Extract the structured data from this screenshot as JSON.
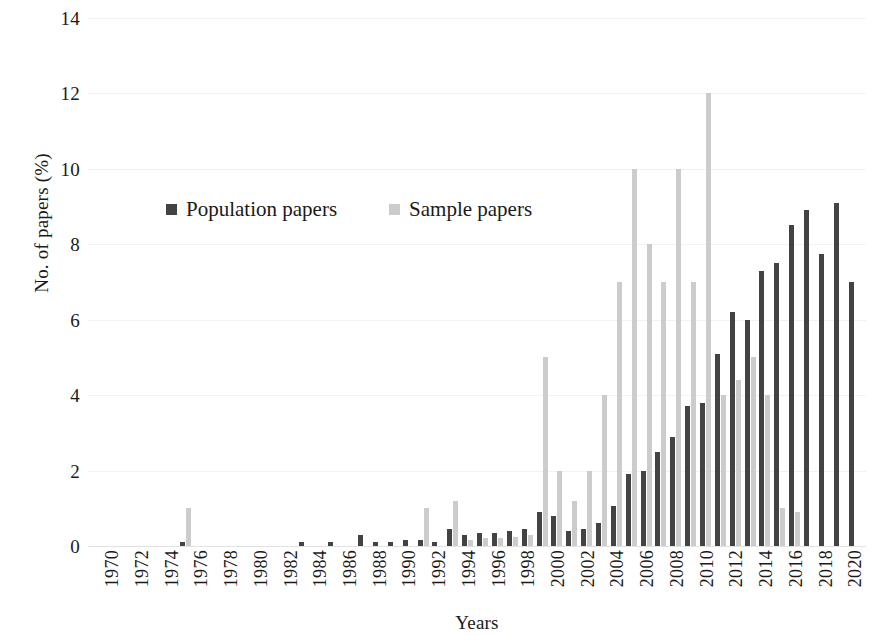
{
  "chart_data": {
    "type": "bar",
    "title": "",
    "xlabel": "Years",
    "ylabel": "No. of papers (%)",
    "ylim": [
      0,
      14
    ],
    "ytick_values": [
      0,
      2,
      4,
      6,
      8,
      10,
      12,
      14
    ],
    "ytick_labels": [
      "0",
      "2",
      "4",
      "6",
      "8",
      "10",
      "12",
      "14"
    ],
    "grid": true,
    "legend_position": "upper-left-inside",
    "xtick_labels": [
      "1970",
      "1972",
      "1974",
      "1976",
      "1978",
      "1980",
      "1982",
      "1984",
      "1986",
      "1988",
      "1990",
      "1992",
      "1994",
      "1996",
      "1998",
      "2000",
      "2002",
      "2004",
      "2006",
      "2008",
      "2010",
      "2012",
      "2014",
      "2016",
      "2018",
      "2020"
    ],
    "categories": [
      "1970",
      "1971",
      "1972",
      "1973",
      "1974",
      "1975",
      "1976",
      "1977",
      "1978",
      "1979",
      "1980",
      "1981",
      "1982",
      "1983",
      "1984",
      "1985",
      "1986",
      "1987",
      "1988",
      "1989",
      "1990",
      "1991",
      "1992",
      "1993",
      "1994",
      "1995",
      "1996",
      "1997",
      "1998",
      "1999",
      "2000",
      "2001",
      "2002",
      "2003",
      "2004",
      "2005",
      "2006",
      "2007",
      "2008",
      "2009",
      "2010",
      "2011",
      "2012",
      "2013",
      "2014",
      "2015",
      "2016",
      "2017",
      "2018",
      "2019",
      "2020",
      "2021"
    ],
    "series": [
      {
        "name": "Population papers",
        "color": "#434343",
        "values": [
          0,
          0,
          0,
          0,
          0,
          0,
          0.1,
          0,
          0,
          0,
          0,
          0,
          0,
          0,
          0.1,
          0,
          0.1,
          0,
          0.3,
          0.1,
          0.1,
          0.15,
          0.15,
          0.1,
          0.45,
          0.3,
          0.35,
          0.35,
          0.4,
          0.45,
          0.9,
          0.8,
          0.4,
          0.45,
          0.6,
          1.05,
          1.9,
          2.0,
          2.5,
          2.9,
          3.7,
          3.8,
          5.1,
          6.2,
          6.0,
          7.3,
          7.5,
          8.5,
          8.9,
          7.75,
          9.1,
          7.0
        ]
      },
      {
        "name": "Sample papers",
        "color": "#cccccc",
        "values": [
          0,
          0,
          0,
          0,
          0,
          0,
          1.0,
          0,
          0,
          0,
          0,
          0,
          0,
          0,
          0,
          0,
          0,
          0,
          0,
          0,
          0,
          0,
          1.0,
          0,
          1.2,
          0.15,
          0.2,
          0.2,
          0.25,
          0.3,
          5.0,
          2.0,
          1.2,
          2.0,
          4.0,
          7.0,
          10.0,
          8.0,
          7.0,
          10.0,
          7.0,
          12.0,
          4.0,
          4.4,
          5.0,
          4.0,
          1.0,
          0.9,
          0,
          0,
          0,
          0
        ]
      }
    ]
  },
  "legend": {
    "entries": [
      {
        "label": "Population papers",
        "swatch": "population-swatch"
      },
      {
        "label": "Sample papers",
        "swatch": "sample-swatch"
      }
    ]
  },
  "axes": {
    "y_title": "No. of papers (%)",
    "x_title": "Years"
  }
}
